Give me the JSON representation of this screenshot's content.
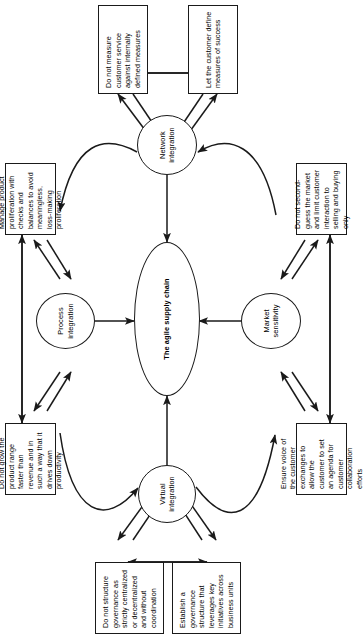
{
  "figure": {
    "title": "The agile supply chain",
    "orientation": "rotated-90",
    "nodes": {
      "center": "The agile supply chain",
      "top": "Virtual integration",
      "left": "Market sensitivity",
      "right": "Process integration",
      "bottom": "Network integration"
    },
    "boxes": {
      "governance_avoid": "Do not structure governance as strictly centralized or decentralized and without coordination",
      "governance_do": "Establish a governance structure that leverages key initiatives across business units",
      "customer_voice": "Ensure voice of the customer exchanges to allow the customer to set an agenda for customer collaboration efforts",
      "customer_avoid": "Do not second-guess the market and limit customer interaction to selling and buying only",
      "product_range_avoid": "Do not grow the product range faster than revenue and in such a way that it drives down productivity",
      "product_proliferation_do": "Manage product proliferation with checks and balances to avoid meaningless, loss-making proliferation",
      "measures_avoid": "Do not measure customer service against internally defined measures",
      "measures_do": "Let the customer define measures of success"
    },
    "colors": {
      "stroke": "#1a1a1a",
      "fill": "#ffffff",
      "text": "#000000"
    }
  }
}
